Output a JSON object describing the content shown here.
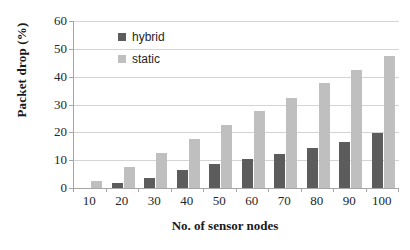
{
  "chart_data": {
    "type": "bar",
    "title": "",
    "xlabel": "No. of sensor nodes",
    "ylabel": "Packet drop (%)",
    "categories": [
      "10",
      "20",
      "30",
      "40",
      "50",
      "60",
      "70",
      "80",
      "90",
      "100"
    ],
    "series": [
      {
        "name": "hybrid",
        "color": "#5c5c5c",
        "values": [
          0,
          1.8,
          3.7,
          6.5,
          8.5,
          10.5,
          12.4,
          14.3,
          16.5,
          19.6
        ]
      },
      {
        "name": "static",
        "color": "#bfbfbf",
        "values": [
          2.5,
          7.7,
          12.5,
          17.5,
          22.6,
          27.6,
          32.4,
          37.8,
          42.5,
          47.6
        ]
      }
    ],
    "ylim": [
      0,
      60
    ],
    "yticks": [
      "0",
      "10",
      "20",
      "30",
      "40",
      "50",
      "60"
    ],
    "ytick_values": [
      0,
      10,
      20,
      30,
      40,
      50,
      60
    ],
    "grid": "horizontal",
    "legend_position": "upper-left-inside",
    "legend": [
      {
        "label": "hybrid",
        "swatch": "legend-swatch-hybrid"
      },
      {
        "label": "static",
        "swatch": "legend-swatch-static"
      }
    ]
  }
}
